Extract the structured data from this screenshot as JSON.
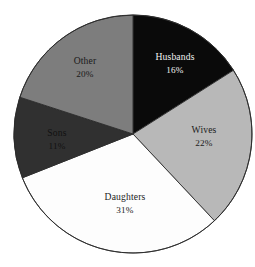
{
  "chart_data": {
    "type": "pie",
    "title": "",
    "subtitle": "",
    "xlabel": "",
    "ylabel": "",
    "legend": "none",
    "grid": false,
    "start_angle_deg": 0,
    "direction": "clockwise",
    "units": "percent",
    "categories": [
      "Husbands",
      "Wives",
      "Daughters",
      "Sons",
      "Other"
    ],
    "values": [
      16,
      22,
      31,
      11,
      20
    ],
    "total": 100,
    "slices": [
      {
        "label": "Husbands",
        "value": 16,
        "value_text": "16%",
        "color": "#0a0a0a",
        "text_color": "#f2f2f2",
        "start_deg": 0,
        "end_deg": 57.6,
        "label_x": 175,
        "label_y": 58,
        "value_x": 175,
        "value_y": 71
      },
      {
        "label": "Wives",
        "value": 22,
        "value_text": "22%",
        "color": "#b8b8b8",
        "text_color": "#1c1c1c",
        "start_deg": 57.6,
        "end_deg": 136.8,
        "label_x": 204,
        "label_y": 131,
        "value_x": 204,
        "value_y": 144
      },
      {
        "label": "Daughters",
        "value": 31,
        "value_text": "31%",
        "color": "#fdfdfd",
        "text_color": "#1c1c1c",
        "start_deg": 136.8,
        "end_deg": 248.4,
        "label_x": 125,
        "label_y": 198,
        "value_x": 125,
        "value_y": 211
      },
      {
        "label": "Sons",
        "value": 11,
        "value_text": "11%",
        "color": "#303030",
        "text_color": "#111111",
        "start_deg": 248.4,
        "end_deg": 288.0,
        "label_x": 57,
        "label_y": 134,
        "value_x": 57,
        "value_y": 147
      },
      {
        "label": "Other",
        "value": 20,
        "value_text": "20%",
        "color": "#7d7d7d",
        "text_color": "#1a1a1a",
        "start_deg": 288.0,
        "end_deg": 360.0,
        "label_x": 85,
        "label_y": 62,
        "value_x": 85,
        "value_y": 75
      }
    ],
    "geometry": {
      "center_x": 133,
      "center_y": 134,
      "radius": 119
    },
    "background_color": "#ffffff",
    "outline_color": "#2b2b2b"
  }
}
